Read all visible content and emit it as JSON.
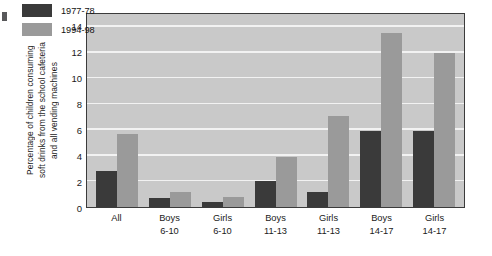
{
  "chart_data": {
    "type": "bar",
    "title": "",
    "xlabel": "",
    "ylabel": "Percentage of children consuming soft drinks from the school cafeteria and all vending machines",
    "ylabel_lines": [
      "Percentage of children consuming",
      "soft drinks from the school cafeteria",
      "and all vending machines"
    ],
    "categories": [
      "All",
      "Boys 6-10",
      "Girls 6-10",
      "Boys 11-13",
      "Girls 11-13",
      "Boys 14-17",
      "Girls 14-17"
    ],
    "category_lines": [
      [
        "All",
        ""
      ],
      [
        "Boys",
        "6-10"
      ],
      [
        "Girls",
        "6-10"
      ],
      [
        "Boys",
        "11-13"
      ],
      [
        "Girls",
        "11-13"
      ],
      [
        "Boys",
        "14-17"
      ],
      [
        "Girls",
        "14-17"
      ]
    ],
    "series": [
      {
        "name": "1977-78",
        "color": "#3a3a3a",
        "values": [
          2.8,
          0.7,
          0.4,
          2.0,
          1.2,
          5.9,
          5.9
        ]
      },
      {
        "name": "1994-98",
        "color": "#9a9a9a",
        "values": [
          5.7,
          1.2,
          0.8,
          3.9,
          7.1,
          13.5,
          12.0
        ]
      }
    ],
    "ylim": [
      0,
      15
    ],
    "yticks": [
      0,
      2,
      4,
      6,
      8,
      10,
      12,
      14
    ],
    "ytick_labels": [
      "0",
      "2",
      "4",
      "6",
      "8",
      "10",
      "12",
      "14"
    ],
    "grid": true,
    "legend_position": "top-left",
    "plot_background": "#c9c9c9",
    "gridline_color": "#f2f2f2"
  }
}
